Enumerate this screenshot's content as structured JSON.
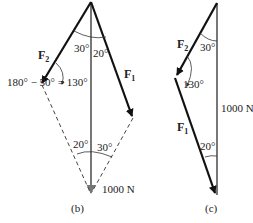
{
  "figure_b": {
    "caption": "(b)",
    "f2_label": "F",
    "f2_sub": "2",
    "f1_label": "F",
    "f1_sub": "1",
    "angle_top_left": "30°",
    "angle_top_right": "20°",
    "angle_left_note": "180° − 50° = 130°",
    "angle_bottom_left": "20°",
    "angle_bottom_right": "30°",
    "resultant_label": "1000 N"
  },
  "figure_c": {
    "caption": "(c)",
    "f2_label": "F",
    "f2_sub": "2",
    "f1_label": "F",
    "f1_sub": "1",
    "angle_top": "30°",
    "angle_middle": "130°",
    "angle_bottom": "20°",
    "resultant_label": "1000 N"
  },
  "colors": {
    "force": "#111111",
    "resultant": "#777777",
    "dashed": "#444444"
  }
}
